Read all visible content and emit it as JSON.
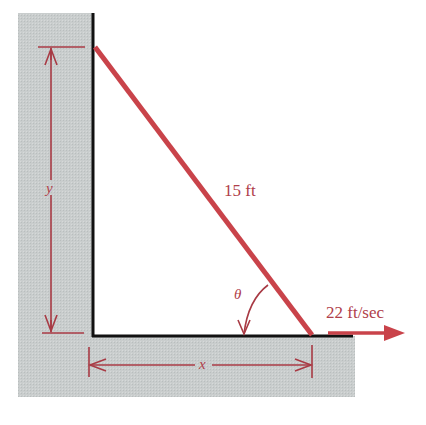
{
  "diagram": {
    "ladder_label": "15 ft",
    "velocity_label": "22 ft/sec",
    "angle_label": "θ",
    "vertical_dim_label": "y",
    "horizontal_dim_label": "x",
    "colors": {
      "ladder": "#c9434a",
      "dimension": "#a83a44",
      "ground": "#c8cccc",
      "wall_line": "#111111"
    }
  }
}
